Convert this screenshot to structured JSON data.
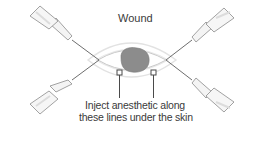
{
  "diagram": {
    "title": "Wound",
    "caption_line1": "Inject anesthetic along",
    "caption_line2": "these lines under the skin",
    "elements": [
      {
        "name": "wound",
        "shape": "irregular-blob",
        "color": "#8a8a8a"
      },
      {
        "name": "syringe-top-left"
      },
      {
        "name": "syringe-top-right"
      },
      {
        "name": "syringe-bottom-left"
      },
      {
        "name": "syringe-bottom-right"
      },
      {
        "name": "injection-line-upper"
      },
      {
        "name": "injection-line-lower"
      },
      {
        "name": "callout-marker-left"
      },
      {
        "name": "callout-marker-right"
      }
    ],
    "colors": {
      "line": "#6e6e6e",
      "skin_outline": "#d6d6d6",
      "wound_fill": "#8c8c8c",
      "text": "#3a3a3a"
    }
  }
}
